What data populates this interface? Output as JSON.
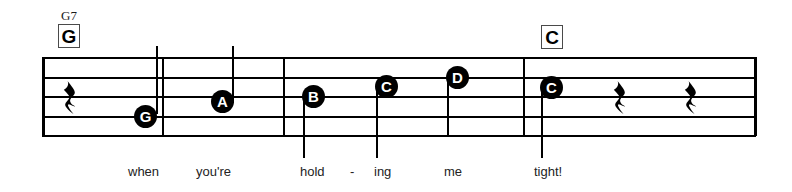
{
  "score": {
    "staff": {
      "left": 42,
      "right": 756,
      "top": 57,
      "line_gap": 19.5,
      "line_count": 5
    },
    "chords": [
      {
        "id": "chord-g",
        "superscript": "G7",
        "box_label": "G",
        "box_x": 58,
        "box_y": 24,
        "super_x": 61,
        "super_y": 9
      },
      {
        "id": "chord-c",
        "superscript": "",
        "box_label": "C",
        "box_x": 541,
        "box_y": 25,
        "super_x": 0,
        "super_y": 0
      }
    ],
    "barlines": [
      {
        "id": "barline-start",
        "x": 42,
        "top": 57,
        "height": 79,
        "thick": true
      },
      {
        "id": "barline-1",
        "x": 162,
        "top": 57,
        "height": 79,
        "thick": false
      },
      {
        "id": "barline-2",
        "x": 283,
        "top": 57,
        "height": 79,
        "thick": false
      },
      {
        "id": "barline-3",
        "x": 523,
        "top": 57,
        "height": 79,
        "thick": false
      },
      {
        "id": "barline-end",
        "x": 754,
        "top": 57,
        "height": 79,
        "thick": true
      }
    ],
    "notes": [
      {
        "id": "note-g",
        "letter": "G",
        "x": 134,
        "y": 105,
        "size": 23,
        "font_size": 15,
        "stem": {
          "x": 156,
          "top": 46,
          "height": 68
        }
      },
      {
        "id": "note-a",
        "letter": "A",
        "x": 211,
        "y": 90,
        "size": 23,
        "font_size": 15,
        "stem": {
          "x": 232,
          "top": 46,
          "height": 57
        }
      },
      {
        "id": "note-b",
        "letter": "B",
        "x": 302,
        "y": 85,
        "size": 23,
        "font_size": 15,
        "stem": {
          "x": 303,
          "top": 95,
          "height": 63
        }
      },
      {
        "id": "note-c-mid",
        "letter": "C",
        "x": 375,
        "y": 75,
        "size": 23,
        "font_size": 15,
        "stem": {
          "x": 376,
          "top": 85,
          "height": 73
        }
      },
      {
        "id": "note-d",
        "letter": "D",
        "x": 446,
        "y": 66,
        "size": 23,
        "font_size": 15,
        "stem": {
          "x": 447,
          "top": 76,
          "height": 60
        }
      },
      {
        "id": "note-c-end",
        "letter": "C",
        "x": 540,
        "y": 76,
        "size": 23,
        "font_size": 15,
        "stem": {
          "x": 541,
          "top": 86,
          "height": 72
        }
      }
    ],
    "rests": [
      {
        "id": "rest-1",
        "glyph": " ",
        "x": 63,
        "y": 80
      },
      {
        "id": "rest-2",
        "glyph": " ",
        "x": 613,
        "y": 80
      },
      {
        "id": "rest-3",
        "glyph": " ",
        "x": 684,
        "y": 80
      }
    ],
    "lyrics": [
      {
        "id": "lyric-when",
        "text": "when",
        "x": 128,
        "y": 165
      },
      {
        "id": "lyric-youre",
        "text": "you're",
        "x": 196,
        "y": 165
      },
      {
        "id": "lyric-hold",
        "text": "hold",
        "x": 300,
        "y": 165
      },
      {
        "id": "lyric-hyphen",
        "text": "-",
        "x": 350,
        "y": 165
      },
      {
        "id": "lyric-ing",
        "text": "ing",
        "x": 374,
        "y": 165
      },
      {
        "id": "lyric-me",
        "text": "me",
        "x": 444,
        "y": 165
      },
      {
        "id": "lyric-tight",
        "text": "tight!",
        "x": 534,
        "y": 165
      }
    ]
  }
}
